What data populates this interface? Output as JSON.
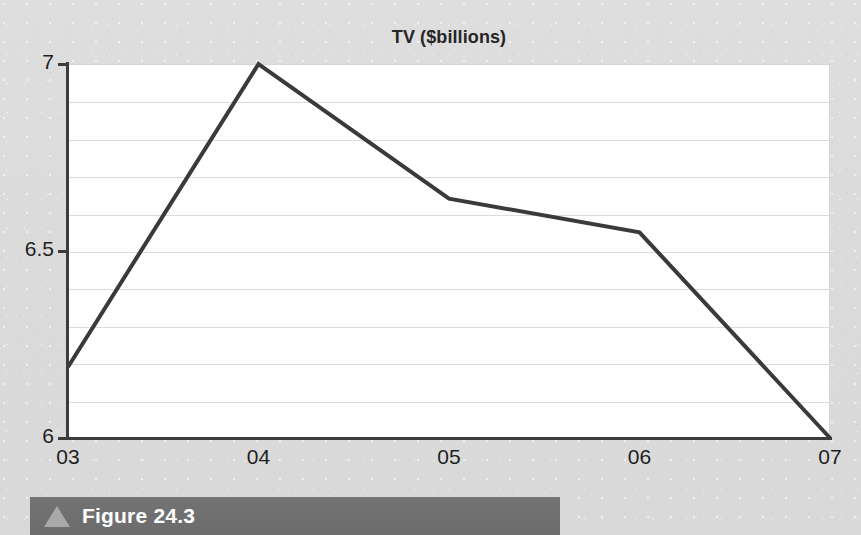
{
  "figure": {
    "caption_label": "Figure 24.3",
    "triangle_icon": "triangle-up-icon",
    "bar_color": "#6e6e6e",
    "triangle_color": "#a9a9a9",
    "caption_text_color": "#ffffff"
  },
  "page": {
    "background_color": "#dcdcdc",
    "ghost_text": ""
  },
  "chart_data": {
    "type": "line",
    "title": "TV ($billions)",
    "xlabel": "",
    "ylabel": "",
    "categories": [
      "03",
      "04",
      "05",
      "06",
      "07"
    ],
    "values": [
      6.19,
      7.0,
      6.64,
      6.55,
      6.0
    ],
    "series": [
      {
        "name": "TV",
        "values": [
          6.19,
          7.0,
          6.64,
          6.55,
          6.0
        ],
        "color": "#3a3a3a",
        "line_width": 4
      }
    ],
    "ylim": [
      6,
      7
    ],
    "xtick_labels": [
      "03",
      "04",
      "05",
      "06",
      "07"
    ],
    "ytick_labels": [
      "6",
      "6.5",
      "7"
    ],
    "ytick_values": [
      6,
      6.5,
      7
    ],
    "grid": true,
    "grid_interval": 0.1,
    "grid_color": "#dcdcdc",
    "grid_orientation": "horizontal",
    "legend": false,
    "legend_position": "none",
    "plot_background": "#ffffff",
    "axis_color": "#3c3c3c",
    "markers": false
  }
}
